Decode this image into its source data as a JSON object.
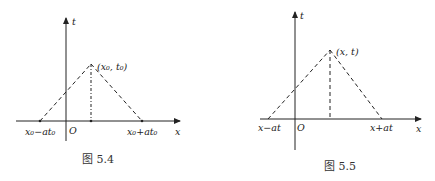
{
  "figures": [
    {
      "id": "fig-5-4",
      "caption": "图 5.4",
      "axis_x_label": "x",
      "axis_t_label": "t",
      "origin_label": "O",
      "apex_label": "(x₀, t₀)",
      "left_base_label": "x₀−at₀",
      "right_base_label": "x₀+at₀",
      "apex_line_style": "dash-dot"
    },
    {
      "id": "fig-5-5",
      "caption": "图 5.5",
      "axis_x_label": "x",
      "axis_t_label": "t",
      "origin_label": "O",
      "apex_label": "(x, t)",
      "left_base_label": "x−at",
      "right_base_label": "x+at",
      "apex_line_style": "dashed"
    }
  ]
}
